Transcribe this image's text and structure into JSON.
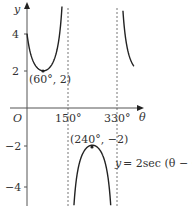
{
  "chart_data": {
    "type": "line",
    "title": "",
    "function": "y = 2sec(θ − 60°)",
    "xlabel": "θ",
    "ylabel": "y",
    "origin_label": "O",
    "x_ticks": [
      {
        "value": 150,
        "label": "150°"
      },
      {
        "value": 330,
        "label": "330°"
      }
    ],
    "y_ticks": [
      {
        "value": 4,
        "label": "4"
      },
      {
        "value": 2,
        "label": "2"
      },
      {
        "value": -2,
        "label": "−2"
      },
      {
        "value": -4,
        "label": "−4"
      }
    ],
    "asymptotes": [
      150,
      330
    ],
    "annotations": [
      {
        "point": [
          60,
          2
        ],
        "label": "(60°, 2)"
      },
      {
        "point": [
          240,
          -2
        ],
        "label": "(240°, −2)"
      },
      {
        "label": "y = 2sec(θ − 60°)"
      }
    ],
    "series": [
      {
        "name": "y = 2sec(θ − 60°)",
        "x": [
          0,
          30,
          60,
          90,
          120,
          130
        ],
        "y": [
          4,
          2.31,
          2,
          2.31,
          4,
          5.85
        ]
      },
      {
        "name": "middle branch",
        "x": [
          170,
          200,
          240,
          280,
          310
        ],
        "y": [
          -5.85,
          -2.61,
          -2,
          -2.61,
          -5.85
        ]
      },
      {
        "name": "right branch",
        "x": [
          350,
          370,
          390
        ],
        "y": [
          5.85,
          3.11,
          2.31
        ]
      }
    ],
    "xlim": [
      -95,
      600
    ],
    "ylim": [
      -5.2,
      5.8
    ],
    "grid": false,
    "legend": null
  },
  "labels": {
    "y_axis": "y",
    "x_axis": "θ",
    "origin": "O",
    "tick_4": "4",
    "tick_2": "2",
    "tick_m2": "−2",
    "tick_m4": "−4",
    "tick_150": "150°",
    "tick_330": "330°",
    "min_point": "(60°, 2)",
    "max_point": "(240°, −2)",
    "equation_y": "y",
    "equation_rest": "= 2sec (θ − 60°)"
  }
}
